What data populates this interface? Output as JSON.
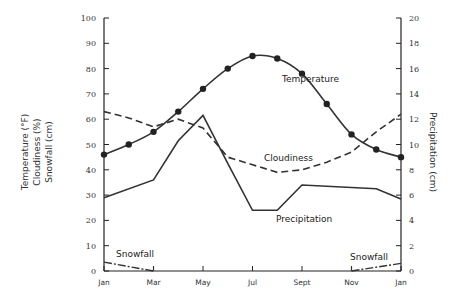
{
  "chart_data": {
    "type": "line",
    "title": "",
    "x": [
      "Jan",
      "Feb",
      "Mar",
      "Apr",
      "May",
      "Jun",
      "Jul",
      "Aug",
      "Sep",
      "Oct",
      "Nov",
      "Dec",
      "Jan"
    ],
    "x_tick_labels": [
      "Jan",
      "Mar",
      "May",
      "Jul",
      "Sept",
      "Nov",
      "Jan"
    ],
    "left_axis": {
      "title_lines": [
        "Temperature (°F)",
        "Cloudiness (%)",
        "Snowfall (cm)"
      ],
      "range": [
        0,
        100
      ],
      "ticks": [
        "0",
        "10",
        "20",
        "30",
        "40",
        "50",
        "60",
        "70",
        "80",
        "90",
        "100"
      ]
    },
    "right_axis": {
      "title": "Precipitation (cm)",
      "range": [
        0,
        20
      ],
      "ticks": [
        "0",
        "2",
        "4",
        "6",
        "8",
        "10",
        "12",
        "14",
        "16",
        "18",
        "20"
      ]
    },
    "grid": false,
    "series": [
      {
        "name": "Temperature",
        "axis": "left",
        "style": "solid-markers",
        "values": [
          46,
          50,
          55,
          63,
          72,
          80,
          85,
          84,
          78,
          66,
          54,
          48,
          45
        ]
      },
      {
        "name": "Cloudiness",
        "axis": "left",
        "style": "dashed",
        "values": [
          63,
          60.5,
          57,
          60,
          56.5,
          45,
          42,
          39,
          40,
          43,
          47,
          55,
          62
        ]
      },
      {
        "name": "Precipitation",
        "axis": "right",
        "style": "solid",
        "points": [
          [
            0,
            5.8
          ],
          [
            2,
            7.2
          ],
          [
            3,
            10.3
          ],
          [
            4,
            12.3
          ],
          [
            5,
            8.5
          ],
          [
            6,
            4.8
          ],
          [
            7,
            4.8
          ],
          [
            8,
            6.8
          ],
          [
            10,
            6.6
          ],
          [
            11,
            6.5
          ],
          [
            12,
            5.7
          ]
        ]
      },
      {
        "name": "Snowfall",
        "axis": "left",
        "style": "dash-dot",
        "points": [
          [
            0,
            3.5
          ],
          [
            2,
            0
          ]
        ],
        "points_end": [
          [
            10,
            0
          ],
          [
            12,
            3
          ]
        ]
      }
    ],
    "annotations": [
      "Temperature",
      "Cloudiness",
      "Precipitation",
      "Snowfall",
      "Snowfall"
    ]
  }
}
